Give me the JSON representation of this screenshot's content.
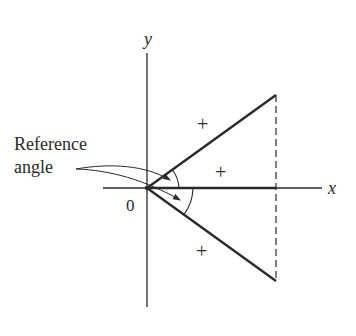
{
  "diagram": {
    "labels": {
      "y_axis": "y",
      "x_axis": "x",
      "origin": "0",
      "reference_line1": "Reference",
      "reference_line2": "angle"
    },
    "signs": {
      "upper_outer": "+",
      "upper_inner": "+",
      "lower": "+"
    },
    "colors": {
      "stroke": "#2a2a2a",
      "background": "#ffffff"
    }
  }
}
